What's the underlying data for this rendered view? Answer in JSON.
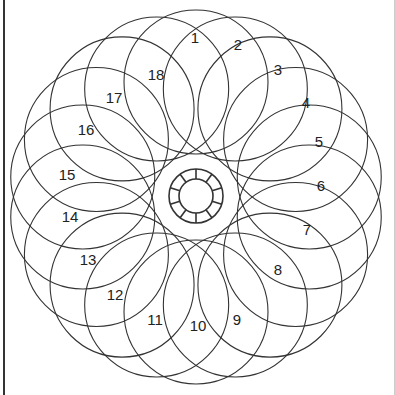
{
  "diagram": {
    "center": [
      196,
      197
    ],
    "orbit_radius": 115,
    "circle_radius": 72,
    "circle_count": 18,
    "stroke_color": "#333333",
    "hub": {
      "outer_radius": 27,
      "inner_radius": 17,
      "segments": 10
    },
    "labels": [
      {
        "text": "1",
        "x": 195,
        "y": 43
      },
      {
        "text": "2",
        "x": 238,
        "y": 50
      },
      {
        "text": "3",
        "x": 278,
        "y": 75
      },
      {
        "text": "4",
        "x": 306,
        "y": 108
      },
      {
        "text": "5",
        "x": 319,
        "y": 147
      },
      {
        "text": "6",
        "x": 321,
        "y": 191
      },
      {
        "text": "7",
        "x": 307,
        "y": 235
      },
      {
        "text": "8",
        "x": 278,
        "y": 275
      },
      {
        "text": "9",
        "x": 237,
        "y": 325
      },
      {
        "text": "10",
        "x": 198,
        "y": 331
      },
      {
        "text": "11",
        "x": 155,
        "y": 325
      },
      {
        "text": "12",
        "x": 115,
        "y": 300
      },
      {
        "text": "13",
        "x": 88,
        "y": 265
      },
      {
        "text": "14",
        "x": 70,
        "y": 222
      },
      {
        "text": "15",
        "x": 67,
        "y": 180
      },
      {
        "text": "16",
        "x": 86,
        "y": 135
      },
      {
        "text": "17",
        "x": 114,
        "y": 103
      },
      {
        "text": "18",
        "x": 156,
        "y": 80
      }
    ]
  }
}
